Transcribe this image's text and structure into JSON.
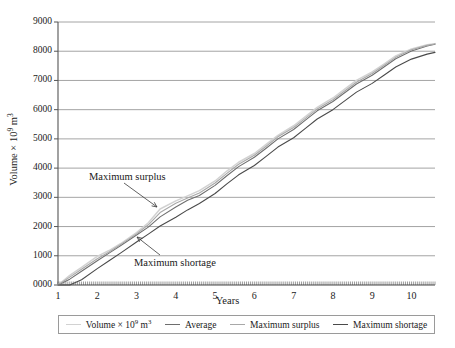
{
  "chart_data": {
    "type": "line",
    "title": "",
    "xlabel": "Years",
    "ylabel": "Volume × 10⁹ m³",
    "xlim": [
      1,
      10.6
    ],
    "ylim": [
      0,
      9000
    ],
    "grid": true,
    "legend_position": "bottom",
    "xticks": [
      "1",
      "2",
      "3",
      "4",
      "5",
      "6",
      "7",
      "8",
      "9",
      "10"
    ],
    "yticks": [
      "0000",
      "1000",
      "2000",
      "3000",
      "4000",
      "5000",
      "6000",
      "7000",
      "8000",
      "9000"
    ],
    "x": [
      1,
      1.3,
      1.6,
      2,
      2.3,
      2.6,
      3,
      3.3,
      3.6,
      4,
      4.3,
      4.6,
      5,
      5.3,
      5.6,
      6,
      6.3,
      6.6,
      7,
      7.3,
      7.6,
      8,
      8.3,
      8.6,
      9,
      9.3,
      9.6,
      10,
      10.4,
      10.6
    ],
    "series": [
      {
        "name": "Volume × 10⁹ m³",
        "color": "#d2d2d2",
        "values": [
          0,
          330,
          600,
          980,
          1180,
          1420,
          1790,
          2130,
          2600,
          2880,
          3050,
          3230,
          3560,
          3900,
          4200,
          4500,
          4810,
          5120,
          5450,
          5760,
          6080,
          6400,
          6700,
          7000,
          7290,
          7560,
          7840,
          8080,
          8220,
          8260
        ]
      },
      {
        "name": "Average",
        "color": "#6e6e6e",
        "values": [
          0,
          200,
          470,
          830,
          1090,
          1350,
          1710,
          1980,
          2330,
          2670,
          2900,
          3060,
          3410,
          3740,
          4050,
          4370,
          4680,
          5000,
          5320,
          5640,
          5960,
          6280,
          6580,
          6880,
          7180,
          7460,
          7740,
          8010,
          8180,
          8240
        ]
      },
      {
        "name": "Maximum surplus",
        "color": "#a8a8a8",
        "values": [
          0,
          270,
          540,
          900,
          1130,
          1390,
          1750,
          2060,
          2480,
          2800,
          2980,
          3150,
          3490,
          3820,
          4130,
          4440,
          4750,
          5070,
          5390,
          5700,
          6020,
          6340,
          6640,
          6940,
          7240,
          7510,
          7790,
          8050,
          8200,
          8250
        ]
      },
      {
        "name": "Maximum shortage",
        "color": "#4a4a4a",
        "values": [
          0,
          0,
          180,
          560,
          830,
          1100,
          1470,
          1740,
          2020,
          2320,
          2570,
          2790,
          3130,
          3460,
          3770,
          4090,
          4400,
          4720,
          5040,
          5360,
          5680,
          6000,
          6300,
          6600,
          6900,
          7180,
          7460,
          7730,
          7900,
          7960
        ]
      }
    ],
    "annotations": [
      {
        "text": "Maximum surplus",
        "x": 3.0,
        "y": 3600
      },
      {
        "text": "Maximum shortage",
        "x": 4.1,
        "y": 700
      }
    ]
  },
  "legend": {
    "items": [
      {
        "label": "Volume × 10⁹ m³",
        "color": "#d2d2d2"
      },
      {
        "label": "Average",
        "color": "#6e6e6e"
      },
      {
        "label": "Maximum surplus",
        "color": "#a8a8a8"
      },
      {
        "label": "Maximum shortage",
        "color": "#4a4a4a"
      }
    ]
  },
  "axes": {
    "x_title": "Years",
    "y_title_main": "Volume × 10",
    "y_title_exp": "9",
    "y_title_unit": " m",
    "y_title_unit_exp": "3",
    "yticks": [
      "9000",
      "8000",
      "7000",
      "6000",
      "5000",
      "4000",
      "3000",
      "2000",
      "1000",
      "0000"
    ],
    "xticks": [
      "1",
      "2",
      "3",
      "4",
      "5",
      "6",
      "7",
      "8",
      "9",
      "10"
    ]
  },
  "annotations": {
    "surplus": "Maximum surplus",
    "shortage": "Maximum shortage"
  }
}
